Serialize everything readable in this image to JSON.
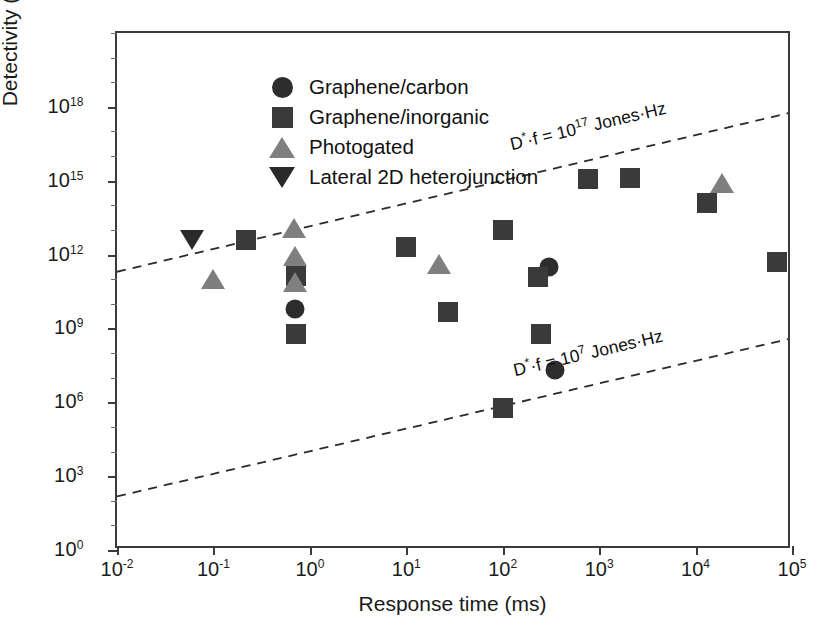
{
  "chart_data": {
    "type": "scatter",
    "title": "",
    "xlabel": "Response time (ms)",
    "ylabel": "Detectivity (Jones)",
    "xscale": "log",
    "yscale": "log",
    "xlim": [
      0.01,
      100000
    ],
    "ylim": [
      1,
      1e+21
    ],
    "grid": false,
    "legend_position": "top-left",
    "x_tick_labels": [
      "10-2",
      "10-1",
      "100",
      "101",
      "102",
      "103",
      "104",
      "105"
    ],
    "x_tick_bases": [
      "10",
      "10",
      "10",
      "10",
      "10",
      "10",
      "10",
      "10"
    ],
    "x_tick_exponents": [
      "-2",
      "-1",
      "0",
      "1",
      "2",
      "3",
      "4",
      "5"
    ],
    "x_tick_values": [
      0.01,
      0.1,
      1,
      10,
      100,
      1000,
      10000,
      100000
    ],
    "y_tick_bases": [
      "10",
      "10",
      "10",
      "10",
      "10",
      "10",
      "10"
    ],
    "y_tick_exponents": [
      "0",
      "3",
      "6",
      "9",
      "12",
      "15",
      "18"
    ],
    "y_tick_values": [
      1,
      1000,
      1000000,
      1000000000,
      1000000000000.0,
      1000000000000000.0,
      1e+18
    ],
    "series": [
      {
        "name": "Graphene/carbon",
        "marker": "circle",
        "color": "#2d2d2d",
        "points": [
          {
            "x": 0.7,
            "y": 6000000000.0
          },
          {
            "x": 300,
            "y": 300000000000.0
          },
          {
            "x": 350,
            "y": 20000000.0
          }
        ]
      },
      {
        "name": "Graphene/inorganic",
        "marker": "square",
        "color": "#3a3a3a",
        "points": [
          {
            "x": 0.22,
            "y": 4000000000000.0
          },
          {
            "x": 0.72,
            "y": 130000000000.0
          },
          {
            "x": 0.72,
            "y": 600000000.0
          },
          {
            "x": 10,
            "y": 2000000000000.0
          },
          {
            "x": 27,
            "y": 4500000000.0
          },
          {
            "x": 100,
            "y": 10000000000000.0
          },
          {
            "x": 100,
            "y": 600000.0
          },
          {
            "x": 230,
            "y": 120000000000.0
          },
          {
            "x": 250,
            "y": 600000000.0
          },
          {
            "x": 760,
            "y": 1200000000000000.0
          },
          {
            "x": 2100,
            "y": 1300000000000000.0
          },
          {
            "x": 13000,
            "y": 120000000000000.0
          },
          {
            "x": 70000,
            "y": 500000000000.0
          }
        ]
      },
      {
        "name": "Photogated",
        "marker": "triangle-up",
        "color": "#7f7f7f",
        "points": [
          {
            "x": 0.1,
            "y": 100000000000.0
          },
          {
            "x": 0.68,
            "y": 12000000000000.0
          },
          {
            "x": 0.7,
            "y": 900000000000.0
          },
          {
            "x": 0.7,
            "y": 80000000000.0
          },
          {
            "x": 22,
            "y": 400000000000.0
          },
          {
            "x": 19000,
            "y": 800000000000000.0
          }
        ]
      },
      {
        "name": "Lateral 2D heterojunction",
        "marker": "triangle-down",
        "color": "#2a2a2a",
        "points": [
          {
            "x": 0.06,
            "y": 4000000000000.0
          }
        ]
      }
    ],
    "annotations": [
      {
        "name": "upper-limit-line",
        "text_parts": {
          "prefix": "D",
          "star": "*",
          "mid": "·f = 10",
          "exp": "17",
          "suffix": " Jones·Hz"
        },
        "text": "D*·f = 10^17 Jones·Hz",
        "line_from": {
          "x": 0.01,
          "y": 200000000000.0
        },
        "line_to": {
          "x": 100000,
          "y": 6e+17
        },
        "style": "dashed"
      },
      {
        "name": "lower-limit-line",
        "text_parts": {
          "prefix": "D",
          "star": "*",
          "mid": "·f = 10",
          "exp": "7",
          "suffix": " Jones·Hz"
        },
        "text": "D*·f = 10^7 Jones·Hz",
        "line_from": {
          "x": 0.01,
          "y": 150.0
        },
        "line_to": {
          "x": 100000,
          "y": 400000000.0
        },
        "style": "dashed"
      }
    ]
  },
  "legend": {
    "items": [
      {
        "label": "Graphene/carbon",
        "marker": "circle",
        "color": "#2d2d2d"
      },
      {
        "label": "Graphene/inorganic",
        "marker": "square",
        "color": "#3a3a3a"
      },
      {
        "label": "Photogated",
        "marker": "triangle-up",
        "color": "#7f7f7f"
      },
      {
        "label": "Lateral 2D heterojunction",
        "marker": "triangle-down",
        "color": "#2a2a2a"
      }
    ]
  },
  "axes": {
    "x_title": "Response time (ms)",
    "y_title": "Detectivity (Jones)"
  },
  "colors": {
    "axis": "#3b3b3b",
    "dark_marker": "#2d2d2d",
    "gray_marker": "#7f7f7f",
    "background": "#ffffff"
  }
}
